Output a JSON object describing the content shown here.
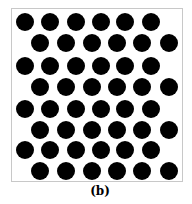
{
  "figure": {
    "label": "(b)",
    "dot_color": "#000000",
    "frame_color": "#c8c8c8",
    "dot_radius": 9,
    "rows": [
      {
        "y": 22,
        "x": [
          25,
          50,
          76,
          101,
          125,
          151
        ]
      },
      {
        "y": 43,
        "x": [
          40,
          66,
          92,
          117,
          142,
          169
        ]
      },
      {
        "y": 66,
        "x": [
          25,
          50,
          76,
          101,
          125,
          151
        ]
      },
      {
        "y": 87,
        "x": [
          40,
          66,
          92,
          117,
          142,
          169
        ]
      },
      {
        "y": 109,
        "x": [
          25,
          50,
          76,
          101,
          125,
          151
        ]
      },
      {
        "y": 130,
        "x": [
          40,
          66,
          92,
          117,
          142,
          169
        ]
      },
      {
        "y": 150,
        "x": [
          25,
          50,
          76,
          101,
          125,
          151
        ]
      },
      {
        "y": 171,
        "x": [
          40,
          66,
          92,
          117,
          142,
          169
        ]
      }
    ]
  }
}
